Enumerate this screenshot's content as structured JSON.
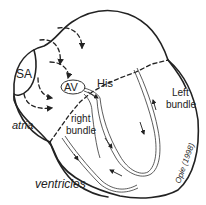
{
  "diagram": {
    "labels": {
      "sa": "SA",
      "av": "AV",
      "his": "His",
      "atria": "atria",
      "right_bundle_1": "right",
      "right_bundle_2": "bundle",
      "left_bundle_1": "Left",
      "left_bundle_2": "bundle",
      "ventricles": "ventricles",
      "credit": "Opie (1998)"
    },
    "colors": {
      "stroke": "#222222",
      "background": "#ffffff"
    }
  }
}
